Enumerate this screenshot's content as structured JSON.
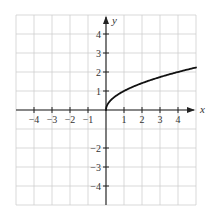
{
  "chart_data": {
    "type": "line",
    "title": "",
    "function": "y = sqrt(x)",
    "xlabel": "x",
    "ylabel": "y",
    "xlim": [
      -5,
      5
    ],
    "ylim": [
      -5,
      5
    ],
    "grid": true,
    "legend": null,
    "x_ticks": [
      -4,
      -3,
      -2,
      -1,
      1,
      2,
      3,
      4
    ],
    "y_ticks": [
      -4,
      -3,
      -2,
      1,
      2,
      3,
      4
    ],
    "x_tick_labels": [
      "−4",
      "−3",
      "−2",
      "−1",
      "1",
      "2",
      "3",
      "4"
    ],
    "y_tick_labels": [
      "−4",
      "−3",
      "−2",
      "1",
      "2",
      "3",
      "4"
    ],
    "series": [
      {
        "name": "sqrt(x)",
        "x": [
          0,
          0.05,
          0.1,
          0.25,
          0.5,
          1,
          1.5,
          2,
          2.5,
          3,
          3.5,
          4,
          4.5,
          5
        ],
        "y": [
          0,
          0.224,
          0.316,
          0.5,
          0.707,
          1,
          1.225,
          1.414,
          1.581,
          1.732,
          1.871,
          2,
          2.121,
          2.236
        ]
      }
    ],
    "colors": {
      "grid": "#cfcfcf",
      "axis": "#222222",
      "curve": "#111111"
    }
  }
}
